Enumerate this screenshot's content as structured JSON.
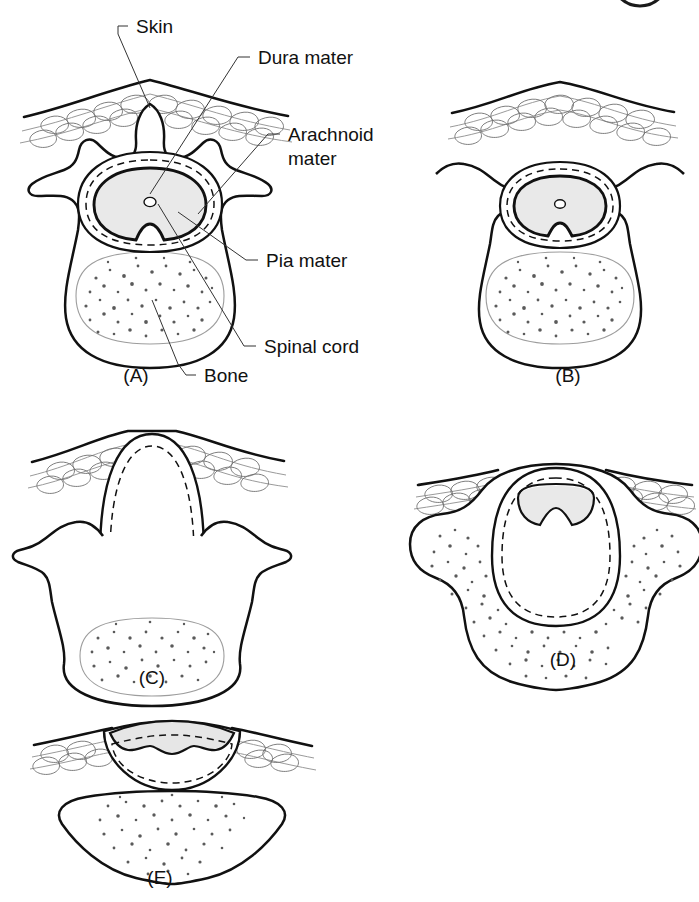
{
  "figure": {
    "kind": "medical-illustration",
    "background_color": "#ffffff",
    "ink_color": "#111111",
    "tissue_fill_color": "#e9e9e9",
    "bone_stipple_color": "#5a5a5a"
  },
  "corner_mark": {
    "name": "clipped-circle-arc",
    "description": "partial dark circular arc clipped by the top-right page edge"
  },
  "callouts": [
    {
      "id": "skin",
      "text": "Skin"
    },
    {
      "id": "dura",
      "text": "Dura mater"
    },
    {
      "id": "arachnoid",
      "text": "Arachnoid"
    },
    {
      "id": "arachnoid2",
      "text": "mater"
    },
    {
      "id": "pia",
      "text": "Pia mater"
    },
    {
      "id": "cord",
      "text": "Spinal cord"
    },
    {
      "id": "bone",
      "text": "Bone"
    }
  ],
  "panels": [
    {
      "id": "A",
      "label": "(A)",
      "caption": "Normal vertebra with intact spinous process, closed dura, arachnoid and pia around the spinal cord",
      "features": [
        "skin",
        "subcutaneous fat",
        "spinous process",
        "transverse processes",
        "dura mater",
        "arachnoid mater",
        "pia mater",
        "spinal cord",
        "central canal",
        "vertebral body bone"
      ]
    },
    {
      "id": "B",
      "label": "(B)",
      "caption": "Spina bifida occulta — defect of the vertebral arch, spinous process absent, skin and meninges intact",
      "features": [
        "skin",
        "subcutaneous fat",
        "absent spinous process",
        "dura mater",
        "arachnoid mater",
        "spinal cord",
        "vertebral body bone"
      ]
    },
    {
      "id": "C",
      "label": "(C)",
      "caption": "Meningocele — meninges herniate through the bony defect forming a cerebrospinal fluid filled sac; spinal cord remains in the canal",
      "features": [
        "skin stretched over sac",
        "meningeal sac",
        "arachnoid mater",
        "spinal cord low in canal",
        "vertebral body bone"
      ]
    },
    {
      "id": "D",
      "label": "(D)",
      "caption": "Myelomeningocele — sac contains meninges and neural tissue displaced out of the vertebral canal",
      "features": [
        "skin",
        "meningeal sac",
        "arachnoid mater",
        "neural tissue in sac",
        "splayed bony laminae"
      ]
    },
    {
      "id": "E",
      "label": "(E)",
      "caption": "Myeloschisis / rachischisis — open neural plate exposed on the surface with no covering sac",
      "features": [
        "exposed neural plate",
        "arachnoid mater",
        "flattened skin",
        "open vertebral body"
      ]
    }
  ]
}
